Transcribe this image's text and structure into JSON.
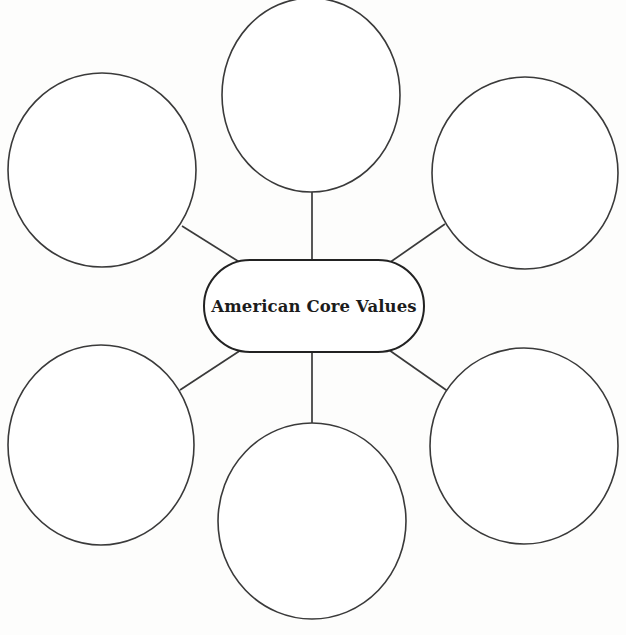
{
  "page": {
    "title": "American Core Values",
    "type": "concept-map-worksheet",
    "background_color": "#fdfdfc",
    "line_color": "#3a3a3a",
    "text_color": "#1c1c1c"
  },
  "center": {
    "label": "American Core Values",
    "shape": "rounded-rectangle",
    "x": 204,
    "y": 260,
    "width": 220,
    "height": 92,
    "corner_radius": 46
  },
  "branches": [
    {
      "id": "branch-top-left",
      "label": "",
      "shape": "circle",
      "cx": 102,
      "cy": 170,
      "rx": 94,
      "ry": 97
    },
    {
      "id": "branch-top-center",
      "label": "",
      "shape": "circle",
      "cx": 311,
      "cy": 95,
      "rx": 89,
      "ry": 97
    },
    {
      "id": "branch-top-right",
      "label": "",
      "shape": "circle",
      "cx": 525,
      "cy": 173,
      "rx": 93,
      "ry": 96
    },
    {
      "id": "branch-bottom-left",
      "label": "",
      "shape": "circle",
      "cx": 101,
      "cy": 445,
      "rx": 93,
      "ry": 100
    },
    {
      "id": "branch-bottom-center",
      "label": "",
      "shape": "circle",
      "cx": 312,
      "cy": 521,
      "rx": 94,
      "ry": 98
    },
    {
      "id": "branch-bottom-right",
      "label": "",
      "shape": "circle",
      "cx": 524,
      "cy": 446,
      "rx": 94,
      "ry": 98
    }
  ],
  "connectors": [
    {
      "id": "connector-top-left",
      "x1": 182,
      "y1": 226,
      "x2": 241,
      "y2": 263
    },
    {
      "id": "connector-top-center",
      "x1": 312,
      "y1": 191,
      "x2": 312,
      "y2": 261
    },
    {
      "id": "connector-top-right",
      "x1": 445,
      "y1": 224,
      "x2": 389,
      "y2": 263
    },
    {
      "id": "connector-bottom-left",
      "x1": 241,
      "y1": 350,
      "x2": 180,
      "y2": 390
    },
    {
      "id": "connector-bottom-center",
      "x1": 312,
      "y1": 351,
      "x2": 312,
      "y2": 424
    },
    {
      "id": "connector-bottom-right",
      "x1": 389,
      "y1": 350,
      "x2": 449,
      "y2": 392
    }
  ]
}
